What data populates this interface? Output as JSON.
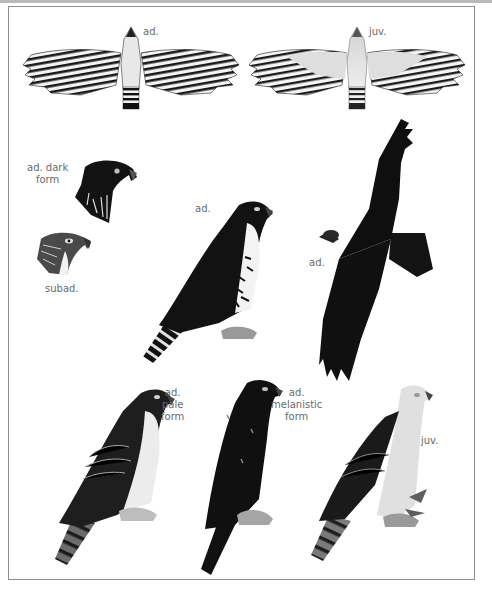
{
  "plate": {
    "figures": [
      {
        "id": "flight-underside-adult",
        "label": "ad.",
        "pose": "flight, underside",
        "plumage": "barred wings and tail"
      },
      {
        "id": "flight-underside-juvenile",
        "label": "juv.",
        "pose": "flight, underside",
        "plumage": "pale body, barred flight feathers"
      },
      {
        "id": "head-adult-dark-form",
        "label_lines": [
          "ad. dark",
          "form"
        ],
        "pose": "head portrait"
      },
      {
        "id": "head-subadult",
        "label": "subad.",
        "pose": "head portrait"
      },
      {
        "id": "perched-adult",
        "label": "ad.",
        "pose": "perched"
      },
      {
        "id": "flight-adult-dark",
        "label": "ad.",
        "pose": "flight, upperside, dark"
      },
      {
        "id": "perched-adult-pale-form",
        "label_lines": [
          "ad.",
          "pale",
          "form"
        ],
        "pose": "perched"
      },
      {
        "id": "perched-adult-melanistic-form",
        "label_lines": [
          "ad.",
          "melanistic",
          "form"
        ],
        "pose": "perched"
      },
      {
        "id": "perched-juvenile",
        "label": "juv.",
        "pose": "perched"
      }
    ]
  },
  "colors": {
    "ink": "#111111",
    "label": "#6a6a6a",
    "frame": "#8e8e8e",
    "juvenile_body": "#dcdcdc"
  }
}
